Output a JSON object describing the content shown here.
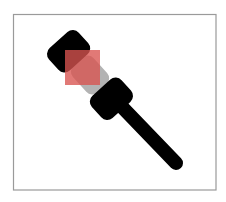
{
  "image": {
    "width": 226,
    "height": 202,
    "background": "#ffffff"
  },
  "frame": {
    "x": 13.5,
    "y": 14.5,
    "width": 202.5,
    "height": 175.5,
    "stroke": "#9a9a9a"
  },
  "gavel": {
    "icon": "gavel-icon",
    "color": "#000000",
    "cylinder_color": "#b3b3b3",
    "rotation_deg": -42
  },
  "highlight": {
    "shape": "square",
    "x": 65,
    "y": 50,
    "width": 35,
    "height": 35,
    "color": "#d9534f",
    "opacity": 0.78
  }
}
